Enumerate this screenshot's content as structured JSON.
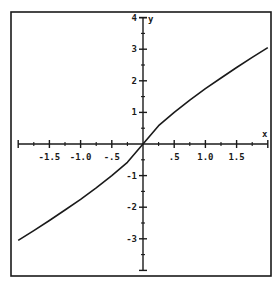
{
  "chart_data": {
    "type": "line",
    "title": "",
    "xlabel": "x",
    "ylabel": "y",
    "xlim": [
      -2,
      2
    ],
    "ylim": [
      -4,
      4
    ],
    "grid": false,
    "legend": "none",
    "x_ticks": [
      {
        "value": -1.5,
        "label": "-1.5"
      },
      {
        "value": -1.0,
        "label": "-1.0"
      },
      {
        "value": -0.5,
        "label": "-.5"
      },
      {
        "value": 0.5,
        "label": ".5"
      },
      {
        "value": 1.0,
        "label": "1.0"
      },
      {
        "value": 1.5,
        "label": "1.5"
      }
    ],
    "x_minor_ticks": [
      -1.75,
      -1.25,
      -0.75,
      -0.25,
      0.25,
      0.75,
      1.25,
      1.75
    ],
    "y_ticks": [
      {
        "value": 4,
        "label": "4"
      },
      {
        "value": 3,
        "label": "3"
      },
      {
        "value": 2,
        "label": "2"
      },
      {
        "value": 1,
        "label": "1"
      },
      {
        "value": -1,
        "label": "-1"
      },
      {
        "value": -2,
        "label": "-2"
      },
      {
        "value": -3,
        "label": "-3"
      }
    ],
    "y_minor_ticks": [
      3.5,
      2.5,
      1.5,
      0.5,
      -0.5,
      -1.5,
      -2.5,
      -3.5
    ],
    "series": [
      {
        "name": "curve",
        "color": "#1a1a1a",
        "x": [
          -2.0,
          -1.75,
          -1.5,
          -1.25,
          -1.0,
          -0.75,
          -0.5,
          -0.25,
          0.0,
          0.25,
          0.5,
          0.75,
          1.0,
          1.25,
          1.5,
          1.75,
          2.0
        ],
        "y": [
          -3.05,
          -2.74,
          -2.42,
          -2.09,
          -1.75,
          -1.39,
          -1.0,
          -0.58,
          0.0,
          0.58,
          1.0,
          1.39,
          1.75,
          2.09,
          2.42,
          2.74,
          3.05
        ]
      }
    ]
  }
}
